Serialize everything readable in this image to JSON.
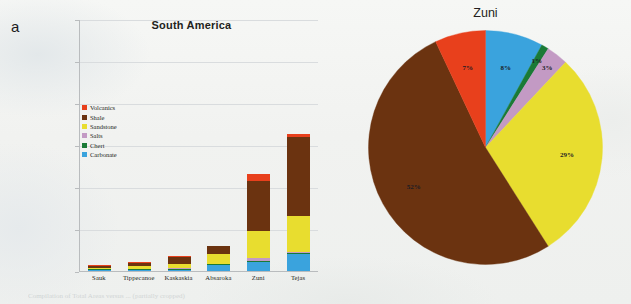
{
  "figure": {
    "panel_a_letter": "a",
    "panel_b_letter": "b",
    "caption": "Compilation of Total Areas versus ... (partially cropped)"
  },
  "palette": {
    "volcanics": "#e8401c",
    "shale": "#6b3310",
    "sandstone": "#e8dd2f",
    "salts": "#c39ac4",
    "chert": "#1a7a36",
    "carbonate": "#3aa3dd",
    "axis": "#b9bcbe",
    "grid": "#d9dcde",
    "text": "#231f20"
  },
  "chart_data": [
    {
      "type": "bar",
      "id": "panel-a",
      "title": "South America",
      "xlabel": "",
      "ylabel": "",
      "ylim": [
        0,
        60000000
      ],
      "grid": true,
      "stacked": true,
      "legend_position": "inside-upper-left",
      "ytick_labels": [
        "60,000,000",
        "50,000,000",
        "40,000,000",
        "30,000,000",
        "20,000,000",
        "10,000,000",
        "-"
      ],
      "ytick_values": [
        60000000,
        50000000,
        40000000,
        30000000,
        20000000,
        10000000,
        0
      ],
      "categories": [
        "Sauk",
        "Tippecanoe",
        "Kaskaskia",
        "Absaroka",
        "Zuni",
        "Tejas"
      ],
      "series": [
        {
          "name": "Carbonate",
          "color": "#3aa3dd",
          "values": [
            50000,
            150000,
            300000,
            1400000,
            2100000,
            4000000
          ]
        },
        {
          "name": "Chert",
          "color": "#1a7a36",
          "values": [
            20000,
            30000,
            60000,
            120000,
            230000,
            200000
          ]
        },
        {
          "name": "Salts",
          "color": "#c39ac4",
          "values": [
            20000,
            30000,
            60000,
            150000,
            700000,
            250000
          ]
        },
        {
          "name": "Sandstone",
          "color": "#e8dd2f",
          "values": [
            200000,
            700000,
            1100000,
            2200000,
            6500000,
            8600000
          ]
        },
        {
          "name": "Shale",
          "color": "#6b3310",
          "values": [
            400000,
            700000,
            1500000,
            1900000,
            12000000,
            18800000
          ]
        },
        {
          "name": "Volcanics",
          "color": "#e8401c",
          "values": [
            30000,
            40000,
            80000,
            130000,
            1600000,
            800000
          ]
        }
      ],
      "totals": [
        720000,
        1650000,
        3100000,
        5900000,
        23130000,
        32650000
      ],
      "legend_entries": [
        "Volcanics",
        "Shale",
        "Sandstone",
        "Salts",
        "Chert",
        "Carbonate"
      ]
    },
    {
      "type": "pie",
      "id": "panel-b",
      "title": "Zuni",
      "start_angle_deg": 0,
      "direction": "clockwise",
      "labels": [
        "Carbonate",
        "Chert",
        "Salts",
        "Sandstone",
        "Shale",
        "Volcanics"
      ],
      "values": [
        8,
        1,
        3,
        29,
        52,
        7
      ],
      "value_labels": [
        "8%",
        "1%",
        "3%",
        "29%",
        "52%",
        "7%"
      ],
      "colors": [
        "#3aa3dd",
        "#1a7a36",
        "#c39ac4",
        "#e8dd2f",
        "#6b3310",
        "#e8401c"
      ]
    }
  ]
}
